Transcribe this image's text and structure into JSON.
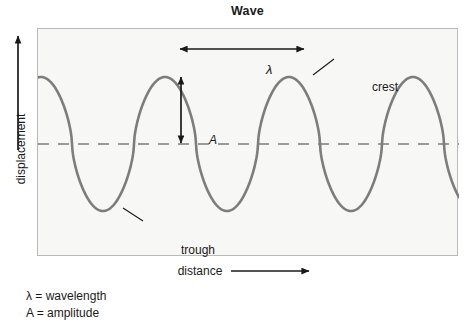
{
  "title": "Wave",
  "axes": {
    "y_label": "displacement",
    "x_label": "distance",
    "y_arrow_icon": "arrow-up-icon",
    "x_arrow_icon": "arrow-right-icon"
  },
  "annotations": {
    "wavelength_symbol": "λ",
    "amplitude_symbol": "A",
    "crest_label": "crest",
    "trough_label": "trough"
  },
  "legend": {
    "lines": [
      "λ = wavelength",
      "A = amplitude"
    ]
  },
  "colors": {
    "wave_line": "#7d7d7d",
    "equilibrium_line": "#9a9a9a",
    "frame_border": "#b9b9b9",
    "plot_background": "#f7f7f5",
    "annotation": "#1a1a1a",
    "text": "#1a1a1a"
  },
  "chart_data": {
    "type": "line",
    "title": "Wave",
    "xlabel": "distance",
    "ylabel": "displacement",
    "grid": false,
    "legend_position": "below-plot",
    "axis_ticks": false,
    "plot_box": {
      "x": 37,
      "y": 28,
      "width": 421,
      "height": 228
    },
    "equilibrium_y": 143,
    "amplitude_px": 67,
    "wavelength_px": 124,
    "waveform": "flattened-sinusoid",
    "waveform_exponent": 0.62,
    "phase_start": "crest",
    "crests_x": [
      40,
      180,
      303,
      425
    ],
    "troughs_x": [
      115,
      242,
      365
    ],
    "crest_y": 70,
    "trough_y": 210,
    "series": [
      {
        "name": "wave",
        "description": "periodic transverse wave, 3.4 cycles across plot"
      }
    ],
    "markers": [
      {
        "name": "wavelength-arrow",
        "type": "double-arrow-horizontal",
        "x1": 178,
        "x2": 303,
        "y": 48,
        "label": "λ"
      },
      {
        "name": "amplitude-arrow",
        "type": "double-arrow-vertical",
        "x": 180,
        "y1": 76,
        "y2": 142,
        "label": "A"
      },
      {
        "name": "crest-leader",
        "type": "leader-line",
        "x1": 312,
        "y1": 74,
        "x2": 333,
        "y2": 58,
        "label": "crest"
      },
      {
        "name": "trough-leader",
        "type": "leader-line",
        "x1": 122,
        "y1": 207,
        "x2": 141,
        "y2": 220,
        "label": "trough"
      }
    ]
  }
}
